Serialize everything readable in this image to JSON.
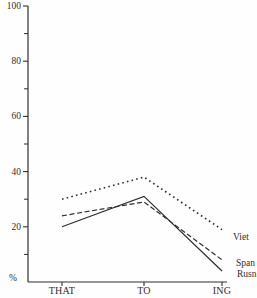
{
  "figure": {
    "ink": "#2e2e2e",
    "background": "#fefefe"
  },
  "chart_data": {
    "type": "line",
    "title": "",
    "xlabel": "",
    "ylabel": "%",
    "categories": [
      "THAT",
      "TO",
      "ING"
    ],
    "series": [
      {
        "name": "Viet",
        "line_style": "dotted",
        "values": [
          30,
          38,
          19
        ]
      },
      {
        "name": "Span",
        "line_style": "dashed",
        "values": [
          24,
          29,
          8
        ]
      },
      {
        "name": "Rusn",
        "line_style": "solid",
        "values": [
          20,
          31,
          4
        ]
      }
    ],
    "ylim": [
      0,
      100
    ],
    "yticks_major": [
      {
        "value": 0,
        "label": "%"
      },
      {
        "value": 20,
        "label": "20"
      },
      {
        "value": 40,
        "label": "40"
      },
      {
        "value": 60,
        "label": "60"
      },
      {
        "value": 80,
        "label": "80"
      },
      {
        "value": 100,
        "label": "100"
      }
    ],
    "yticks_minor": [
      10,
      30,
      50,
      70,
      90
    ],
    "grid": false,
    "legend_position": "labels-at-right-line-ends"
  }
}
